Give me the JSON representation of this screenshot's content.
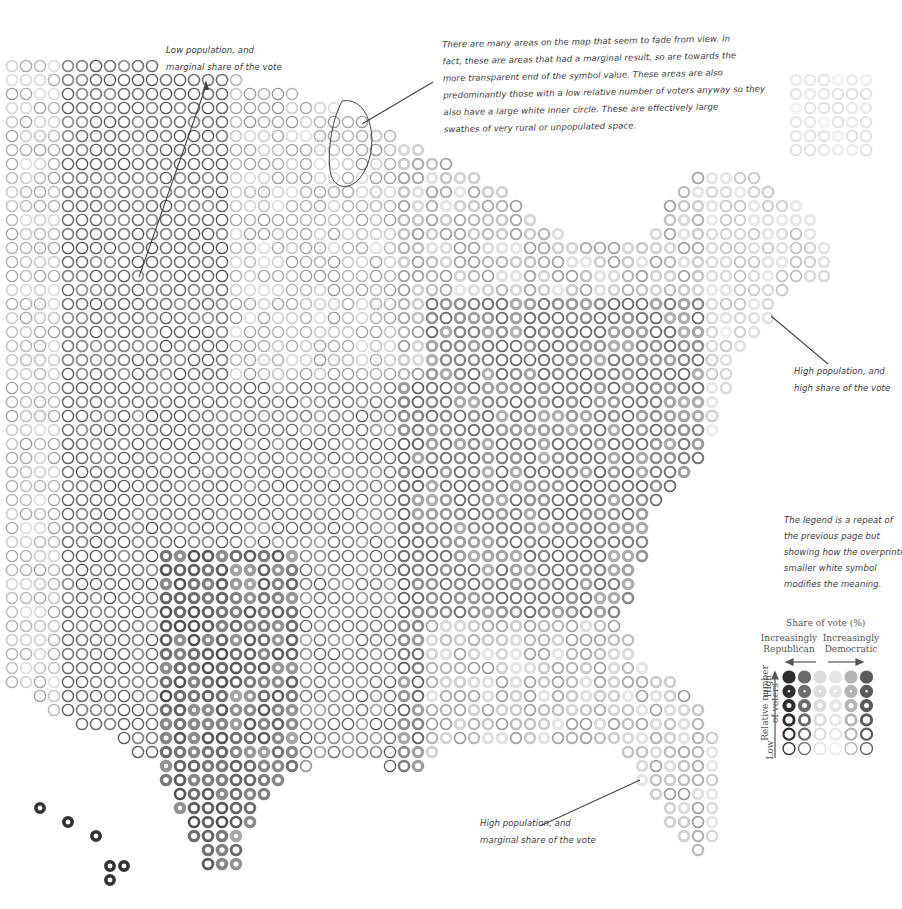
{
  "annotations": {
    "low_pop_marginal": {
      "lines": [
        "Low population, and",
        "marginal share of the vote"
      ]
    },
    "fade_explanation": {
      "lines": [
        "There are many areas on the map that seem to fade from view. In",
        "fact, these are areas that had a marginal result, so are towards the",
        "more transparent end of the symbol value. These areas are also",
        "predominantly those with a low relative number of voters anyway so they",
        "also have a large white inner circle. These are effectively large",
        "swathes of very rural or unpopulated space."
      ]
    },
    "high_pop_high_share": {
      "lines": [
        "High population, and",
        "high share of the vote"
      ]
    },
    "legend_note": {
      "lines": [
        "The legend is a repeat of",
        "the previous page but",
        "showing how the overprinted",
        "smaller white symbol",
        "modifies the meaning."
      ]
    },
    "high_pop_marginal": {
      "lines": [
        "High population, and",
        "marginal share of the vote"
      ]
    }
  },
  "legend": {
    "title": "Share of vote (%)",
    "left_label": [
      "Increasingly",
      "Republican"
    ],
    "right_label": [
      "Increasingly",
      "Democratic"
    ],
    "y_axis_label": [
      "Relative number",
      "of voters"
    ],
    "y_high": "High",
    "y_low": "Low",
    "columns": [
      {
        "side": "republican",
        "color": "#2e2e2e"
      },
      {
        "side": "republican",
        "color": "#6a6a6a"
      },
      {
        "side": "marginal",
        "color": "#dcdcdc"
      },
      {
        "side": "marginal",
        "color": "#e6e6e6"
      },
      {
        "side": "democratic",
        "color": "#b4b4b4"
      },
      {
        "side": "democratic",
        "color": "#5a5a5a"
      }
    ],
    "rows_inner_hole_ratio": [
      0.0,
      0.2,
      0.38,
      0.55,
      0.68,
      0.8
    ]
  },
  "map": {
    "type": "dot-grid choropleth (US county election results)",
    "pitch_px": 14,
    "ring_color": "#3a3a3a",
    "background": "#ffffff"
  }
}
